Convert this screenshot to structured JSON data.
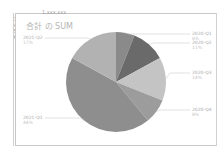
{
  "sheet": {
    "row_numbers": [
      "3",
      "4",
      "5",
      "6"
    ],
    "top_value": "1,xxx,xxx"
  },
  "chart_data": {
    "type": "pie",
    "title": "合計 の SUM",
    "categories": [
      "2020-Q1",
      "2020-Q2",
      "2020-Q3",
      "2020-Q4",
      "2021-Q1",
      "2021-Q2"
    ],
    "values": [
      6,
      11,
      14,
      8,
      44,
      17
    ],
    "value_unit": "%",
    "colors": [
      "#8a8a8a",
      "#6a6a6a",
      "#c4c4c4",
      "#9c9c9c",
      "#8e8e8e",
      "#b2b2b2"
    ],
    "legend": "none (leader-line data labels)",
    "labels": [
      {
        "name": "2020-Q1",
        "pct": "6%"
      },
      {
        "name": "2020-Q2",
        "pct": "11%"
      },
      {
        "name": "2020-Q3",
        "pct": "14%"
      },
      {
        "name": "2020-Q4",
        "pct": "8%"
      },
      {
        "name": "2021-Q1",
        "pct": "44%"
      },
      {
        "name": "2021-Q2",
        "pct": "17%"
      }
    ]
  }
}
